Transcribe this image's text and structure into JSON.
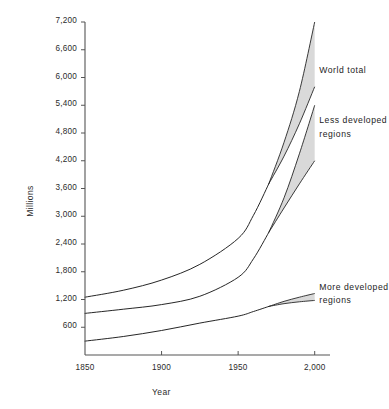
{
  "chart_data": {
    "type": "line",
    "title": "",
    "xlabel": "Year",
    "ylabel": "Millions",
    "xlim": [
      1850,
      2010
    ],
    "ylim": [
      0,
      7200
    ],
    "grid": false,
    "legend_position": "inline-right",
    "x_ticks": [
      "1850",
      "1900",
      "1950",
      "2,000"
    ],
    "x_tick_values": [
      1850,
      1900,
      1950,
      2000
    ],
    "y_ticks": [
      "600",
      "1,200",
      "1,800",
      "2,400",
      "3,000",
      "3,600",
      "4,200",
      "4,800",
      "5,400",
      "6,000",
      "6,600",
      "7,200"
    ],
    "y_tick_values": [
      600,
      1200,
      1800,
      2400,
      3000,
      3600,
      4200,
      4800,
      5400,
      6000,
      6600,
      7200
    ],
    "x": [
      1850,
      1875,
      1900,
      1925,
      1950,
      1960,
      1970,
      1980,
      1990,
      2000
    ],
    "series": [
      {
        "name": "World total",
        "values": [
          1250,
          1400,
          1620,
          1960,
          2520,
          3020,
          3700,
          4450,
          5300,
          6400
        ],
        "band_low": [
          1250,
          1400,
          1620,
          1960,
          2520,
          3020,
          3700,
          4300,
          5000,
          5800
        ],
        "band_high": [
          1250,
          1400,
          1620,
          1960,
          2520,
          3020,
          3700,
          4600,
          5700,
          7200
        ],
        "band_start_year": 1970
      },
      {
        "name": "Less developed regions",
        "values": [
          900,
          990,
          1090,
          1270,
          1680,
          2080,
          2650,
          3300,
          4050,
          4800
        ],
        "band_low": [
          900,
          990,
          1090,
          1270,
          1680,
          2080,
          2650,
          3180,
          3700,
          4200
        ],
        "band_high": [
          900,
          990,
          1090,
          1270,
          1680,
          2080,
          2650,
          3400,
          4350,
          5400
        ],
        "band_start_year": 1970
      },
      {
        "name": "More developed regions",
        "values": [
          300,
          400,
          530,
          690,
          840,
          940,
          1050,
          1140,
          1210,
          1260
        ],
        "band_low": [
          300,
          400,
          530,
          690,
          840,
          940,
          1050,
          1110,
          1150,
          1180
        ],
        "band_high": [
          300,
          400,
          530,
          690,
          840,
          940,
          1050,
          1160,
          1250,
          1330
        ],
        "band_start_year": 1970
      }
    ],
    "annotations": [
      {
        "text_line1": "World total",
        "text_line2": "",
        "x": 2003,
        "y": 6150
      },
      {
        "text_line1": "Less developed",
        "text_line2": "regions",
        "x": 2003,
        "y": 5050
      },
      {
        "text_line1": "More developed",
        "text_line2": "regions",
        "x": 2003,
        "y": 1450
      }
    ],
    "colors": {
      "line": "#1a1a1a",
      "band_fill": "#d9d9d9",
      "axis": "#555555",
      "text": "#1d1d1d",
      "background": "#ffffff"
    }
  }
}
